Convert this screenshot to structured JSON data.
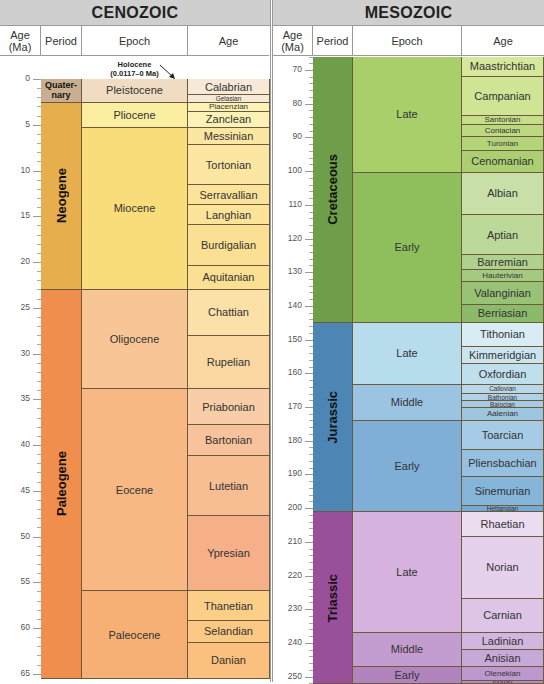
{
  "chart_data": [
    {
      "type": "table",
      "title": "CENOZOIC",
      "columns": [
        "Age (Ma)",
        "Period",
        "Epoch",
        "Age"
      ],
      "axis": {
        "label": "Age (Ma)",
        "ticks": [
          0,
          5,
          10,
          15,
          20,
          25,
          30,
          35,
          40,
          45,
          50,
          55,
          60,
          65
        ],
        "range": [
          0,
          66
        ]
      },
      "annotation": "Holocene (0.0117–0 Ma)",
      "periods": [
        {
          "name": "Quaternary",
          "label": "Quater-nary",
          "start": 0,
          "end": 2.58,
          "color": "#c9ae8f"
        },
        {
          "name": "Neogene",
          "start": 2.58,
          "end": 23.03,
          "color": "#e7ae4e"
        },
        {
          "name": "Paleogene",
          "start": 23.03,
          "end": 66.0,
          "color": "#ef8e4d"
        }
      ],
      "epochs": [
        {
          "name": "Pleistocene",
          "start": 0,
          "end": 2.58,
          "color": "#f0dcc2"
        },
        {
          "name": "Pliocene",
          "start": 2.58,
          "end": 5.33,
          "color": "#fbeea0"
        },
        {
          "name": "Miocene",
          "start": 5.33,
          "end": 23.03,
          "color": "#f9dd7a"
        },
        {
          "name": "Oligocene",
          "start": 23.03,
          "end": 33.9,
          "color": "#f8c696"
        },
        {
          "name": "Eocene",
          "start": 33.9,
          "end": 56.0,
          "color": "#f7b883"
        },
        {
          "name": "Paleocene",
          "start": 56.0,
          "end": 66.0,
          "color": "#f6b076"
        }
      ],
      "ages": [
        {
          "name": "Calabrian",
          "start": 0,
          "end": 1.8,
          "color": "#f6e9d8"
        },
        {
          "name": "Gelasian",
          "start": 1.8,
          "end": 2.58,
          "color": "#f6e9d8"
        },
        {
          "name": "Piacenzian",
          "start": 2.58,
          "end": 3.6,
          "color": "#fcf2b5"
        },
        {
          "name": "Zanclean",
          "start": 3.6,
          "end": 5.33,
          "color": "#fcf2b5"
        },
        {
          "name": "Messinian",
          "start": 5.33,
          "end": 7.25,
          "color": "#fbe7a1"
        },
        {
          "name": "Tortonian",
          "start": 7.25,
          "end": 11.63,
          "color": "#fbe7a1"
        },
        {
          "name": "Serravallian",
          "start": 11.63,
          "end": 13.82,
          "color": "#fbe39a"
        },
        {
          "name": "Langhian",
          "start": 13.82,
          "end": 15.97,
          "color": "#fbe39a"
        },
        {
          "name": "Burdigalian",
          "start": 15.97,
          "end": 20.44,
          "color": "#fbdf92"
        },
        {
          "name": "Aquitanian",
          "start": 20.44,
          "end": 23.03,
          "color": "#fbdf92"
        },
        {
          "name": "Chattian",
          "start": 23.03,
          "end": 28.1,
          "color": "#fbe0a8"
        },
        {
          "name": "Rupelian",
          "start": 28.1,
          "end": 33.9,
          "color": "#fbd8a1"
        },
        {
          "name": "Priabonian",
          "start": 33.9,
          "end": 37.8,
          "color": "#f9cda7"
        },
        {
          "name": "Bartonian",
          "start": 37.8,
          "end": 41.2,
          "color": "#f8c29d"
        },
        {
          "name": "Lutetian",
          "start": 41.2,
          "end": 47.8,
          "color": "#f7bd93"
        },
        {
          "name": "Ypresian",
          "start": 47.8,
          "end": 56.0,
          "color": "#f5b08a"
        },
        {
          "name": "Thanetian",
          "start": 56.0,
          "end": 59.2,
          "color": "#fbcf88"
        },
        {
          "name": "Selandian",
          "start": 59.2,
          "end": 61.6,
          "color": "#fbc983"
        },
        {
          "name": "Danian",
          "start": 61.6,
          "end": 66.0,
          "color": "#fbc07d"
        }
      ]
    },
    {
      "type": "table",
      "title": "MESOZOIC",
      "columns": [
        "Age (Ma)",
        "Period",
        "Epoch",
        "Age"
      ],
      "axis": {
        "label": "Age (Ma)",
        "ticks": [
          70,
          80,
          90,
          100,
          110,
          120,
          130,
          140,
          150,
          160,
          170,
          180,
          190,
          200,
          210,
          220,
          230,
          240,
          250
        ],
        "range": [
          66,
          252
        ]
      },
      "periods": [
        {
          "name": "Cretaceous",
          "start": 66.0,
          "end": 145.0,
          "color": "#6e9e4a"
        },
        {
          "name": "Jurassic",
          "start": 145.0,
          "end": 201.3,
          "color": "#4d86b5"
        },
        {
          "name": "Triassic",
          "start": 201.3,
          "end": 252.2,
          "color": "#9a4f9b"
        }
      ],
      "epochs": [
        {
          "name": "Late",
          "period": "Cretaceous",
          "start": 66.0,
          "end": 100.5,
          "color": "#a8cf6a"
        },
        {
          "name": "Early",
          "period": "Cretaceous",
          "start": 100.5,
          "end": 145.0,
          "color": "#8fbf5c"
        },
        {
          "name": "Late",
          "period": "Jurassic",
          "start": 145.0,
          "end": 163.5,
          "color": "#b7dcec"
        },
        {
          "name": "Middle",
          "period": "Jurassic",
          "start": 163.5,
          "end": 174.1,
          "color": "#9bc4e2"
        },
        {
          "name": "Early",
          "period": "Jurassic",
          "start": 174.1,
          "end": 201.3,
          "color": "#7faed6"
        },
        {
          "name": "Late",
          "period": "Triassic",
          "start": 201.3,
          "end": 237.0,
          "color": "#d5b3de"
        },
        {
          "name": "Middle",
          "period": "Triassic",
          "start": 237.0,
          "end": 247.2,
          "color": "#c49dd0"
        },
        {
          "name": "Early",
          "period": "Triassic",
          "start": 247.2,
          "end": 252.2,
          "color": "#b184c0"
        }
      ],
      "ages": [
        {
          "name": "Maastrichtian",
          "start": 66.0,
          "end": 72.1,
          "color": "#d5e89c"
        },
        {
          "name": "Campanian",
          "start": 72.1,
          "end": 83.6,
          "color": "#cfe495"
        },
        {
          "name": "Santonian",
          "start": 83.6,
          "end": 86.3,
          "color": "#c6de8a"
        },
        {
          "name": "Coniacian",
          "start": 86.3,
          "end": 89.8,
          "color": "#bcd982"
        },
        {
          "name": "Turonian",
          "start": 89.8,
          "end": 93.9,
          "color": "#b4d47a"
        },
        {
          "name": "Cenomanian",
          "start": 93.9,
          "end": 100.5,
          "color": "#abcf72"
        },
        {
          "name": "Albian",
          "start": 100.5,
          "end": 113.0,
          "color": "#c8e0a8"
        },
        {
          "name": "Aptian",
          "start": 113.0,
          "end": 125.0,
          "color": "#bcd99a"
        },
        {
          "name": "Barremian",
          "start": 125.0,
          "end": 129.4,
          "color": "#b0d18e"
        },
        {
          "name": "Hauterivian",
          "start": 129.4,
          "end": 132.9,
          "color": "#a4ca82"
        },
        {
          "name": "Valanginian",
          "start": 132.9,
          "end": 139.8,
          "color": "#98c276"
        },
        {
          "name": "Berriasian",
          "start": 139.8,
          "end": 145.0,
          "color": "#8cba6b"
        },
        {
          "name": "Tithonian",
          "start": 145.0,
          "end": 152.1,
          "color": "#d8ecf4"
        },
        {
          "name": "Kimmeridgian",
          "start": 152.1,
          "end": 157.3,
          "color": "#cbe5f0"
        },
        {
          "name": "Oxfordian",
          "start": 157.3,
          "end": 163.5,
          "color": "#bfdfec"
        },
        {
          "name": "Callovian",
          "start": 163.5,
          "end": 166.1,
          "color": "#b9d7ea"
        },
        {
          "name": "Bathonian",
          "start": 166.1,
          "end": 168.3,
          "color": "#b0d1e6"
        },
        {
          "name": "Bajocian",
          "start": 168.3,
          "end": 170.3,
          "color": "#a7cbe2"
        },
        {
          "name": "Aalenian",
          "start": 170.3,
          "end": 174.1,
          "color": "#9ec5de"
        },
        {
          "name": "Toarcian",
          "start": 174.1,
          "end": 182.7,
          "color": "#a6cbe6"
        },
        {
          "name": "Pliensbachian",
          "start": 182.7,
          "end": 190.8,
          "color": "#96c0e0"
        },
        {
          "name": "Sinemurian",
          "start": 190.8,
          "end": 199.3,
          "color": "#86b5da"
        },
        {
          "name": "Hettangian",
          "start": 199.3,
          "end": 201.3,
          "color": "#76aad4"
        },
        {
          "name": "Rhaetian",
          "start": 201.3,
          "end": 208.5,
          "color": "#ecdcf0"
        },
        {
          "name": "Norian",
          "start": 208.5,
          "end": 227.0,
          "color": "#e5d1ec"
        },
        {
          "name": "Carnian",
          "start": 227.0,
          "end": 237.0,
          "color": "#dcc5e6"
        },
        {
          "name": "Ladinian",
          "start": 237.0,
          "end": 242.0,
          "color": "#d1b6e0"
        },
        {
          "name": "Anisian",
          "start": 242.0,
          "end": 247.2,
          "color": "#c7a9d8"
        },
        {
          "name": "Olenekian",
          "start": 247.2,
          "end": 251.2,
          "color": "#bc98cf"
        },
        {
          "name": "Induan",
          "start": 251.2,
          "end": 252.2,
          "color": "#b28ac8"
        }
      ]
    }
  ],
  "panels": {
    "cenozoic": {
      "title": "CENOZOIC",
      "headers": {
        "age_ma": "Age (Ma)",
        "period": "Period",
        "epoch": "Epoch",
        "age": "Age"
      },
      "holocene_line1": "Holocene",
      "holocene_line2": "(0.0117–0 Ma)"
    },
    "mesozoic": {
      "title": "MESOZOIC",
      "headers": {
        "age_ma": "Age (Ma)",
        "period": "Period",
        "epoch": "Epoch",
        "age": "Age"
      }
    }
  }
}
